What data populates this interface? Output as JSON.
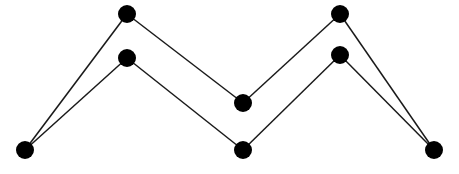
{
  "diagram": {
    "type": "graph",
    "width": 459,
    "height": 174,
    "colors": {
      "node": "#000000",
      "edge": "#1a1a1a",
      "background": "#ffffff"
    },
    "node_radius": 9,
    "edge_width": 1.5,
    "nodes": [
      {
        "id": "left",
        "x": 25,
        "y": 150
      },
      {
        "id": "top-left-upper",
        "x": 127,
        "y": 14
      },
      {
        "id": "top-left-lower",
        "x": 127,
        "y": 58
      },
      {
        "id": "middle-upper",
        "x": 243,
        "y": 103
      },
      {
        "id": "middle-lower",
        "x": 243,
        "y": 150
      },
      {
        "id": "top-right-upper",
        "x": 340,
        "y": 14
      },
      {
        "id": "top-right-lower",
        "x": 340,
        "y": 55
      },
      {
        "id": "right",
        "x": 434,
        "y": 150
      }
    ],
    "edges": [
      [
        "left",
        "top-left-upper"
      ],
      [
        "left",
        "top-left-lower"
      ],
      [
        "top-left-upper",
        "middle-upper"
      ],
      [
        "top-left-lower",
        "middle-lower"
      ],
      [
        "middle-upper",
        "top-right-upper"
      ],
      [
        "middle-lower",
        "top-right-lower"
      ],
      [
        "top-right-upper",
        "right"
      ],
      [
        "top-right-lower",
        "right"
      ]
    ]
  }
}
